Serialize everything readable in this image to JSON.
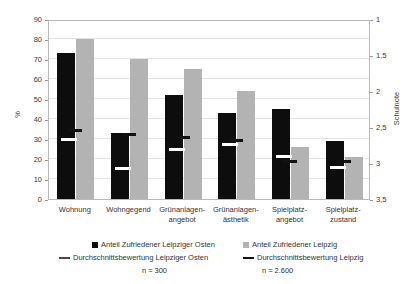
{
  "chart_data": {
    "type": "bar",
    "title": "",
    "subtitle": "",
    "xlabel": "",
    "ylabel": "%",
    "ylabel_secondary": "Schulnote",
    "ylim": [
      0,
      90
    ],
    "ylim_secondary": [
      1,
      3.5
    ],
    "y_secondary_inverted": true,
    "grid": true,
    "legend_position": "bottom",
    "categories": [
      "Wohnung",
      "Wohngegend",
      "Grünanlagen-\nangebot",
      "Grünanlagen-\nästhetik",
      "Spielplatz-\nangebot",
      "Spielplatz-\nzustand"
    ],
    "yticks_left": [
      "0",
      "10",
      "20",
      "30",
      "40",
      "50",
      "60",
      "70",
      "80",
      "90"
    ],
    "yticks_right": [
      "1",
      "1,5",
      "2",
      "2,5",
      "3",
      "3,5"
    ],
    "series": [
      {
        "name": "Anteil Zufriedener Leipziger Osten",
        "kind": "bar",
        "color": "#0d0d0d",
        "axis": "left",
        "unit": "%",
        "values": [
          73,
          33,
          52,
          43,
          45,
          29
        ]
      },
      {
        "name": "Anteil Zufriedener Leipzig",
        "kind": "bar",
        "color": "#b3b3b3",
        "axis": "left",
        "unit": "%",
        "values": [
          80,
          70,
          65,
          54,
          26,
          21
        ]
      },
      {
        "name": "Durchschnittsbewertung Leipziger Osten",
        "kind": "marker",
        "color": "#ffffff",
        "axis": "right",
        "unit": "Schulnote",
        "values": [
          2.65,
          3.05,
          2.78,
          2.72,
          2.88,
          3.03
        ]
      },
      {
        "name": "Durchschnittsbewertung Leipzig",
        "kind": "marker",
        "color": "#111111",
        "axis": "right",
        "unit": "Schulnote",
        "values": [
          2.52,
          2.58,
          2.62,
          2.66,
          2.95,
          2.95
        ]
      }
    ],
    "annotations": [
      "n ≈ 300",
      "n ≈ 2.600"
    ]
  },
  "legend": {
    "items": [
      {
        "label": "Anteil Zufriedener Leipziger Osten",
        "swatch": "square-dark-icon"
      },
      {
        "label": "Anteil Zufriedener Leipzig",
        "swatch": "square-light-icon"
      },
      {
        "label": "Durchschnittsbewertung Leipziger Osten",
        "swatch": "dash-white-icon"
      },
      {
        "label": "Durchschnittsbewertung Leipzig",
        "swatch": "dash-black-icon"
      }
    ],
    "note_left": "n ≈ 300",
    "note_right": "n ≈ 2.600"
  }
}
